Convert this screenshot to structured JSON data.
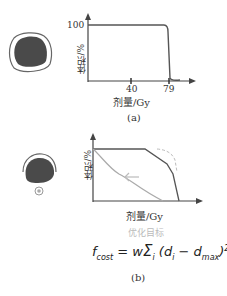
{
  "panel_a": {
    "caption": "(a)",
    "y_label": "体积/%",
    "y_tick": "100",
    "x_label": "剂量/Gy",
    "x_ticks": [
      "40",
      "79"
    ],
    "organ_icon": "target-volume-filled-with-margin"
  },
  "panel_b": {
    "caption": "(b)",
    "y_label": "体积/%",
    "x_label": "剂量/Gy",
    "annotation": "优化目标",
    "formula": "f_cost = w Σ_i (d_i − d_max)²",
    "formula_display": {
      "lhs": "f",
      "lhs_sub": "cost",
      "eq": "= w",
      "sum": "Σ",
      "sum_sub": "i",
      "body": "(d",
      "body_sub1": "i",
      "minus": " − d",
      "body_sub2": "max",
      "close": ")",
      "exp": "2"
    },
    "organ_icon": "organ-at-risk-with-partial-margin"
  },
  "colors": {
    "curve_dark": "#555555",
    "curve_light": "#aaaaaa",
    "dashed": "#bbbbbb",
    "organ_fill": "#4a4a4a"
  }
}
